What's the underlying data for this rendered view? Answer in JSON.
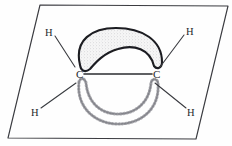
{
  "figure": {
    "background_color": "#fefefe",
    "ink_color": "#25262b",
    "plane": {
      "name": "molecular-plane",
      "shape": "parallelogram",
      "stroke_color": "#3a3b40",
      "points": "40,5 228,6 196,139 8,138"
    },
    "bond": {
      "label": "carbon-carbon sigma bond",
      "stroke_color": "#2b2c31",
      "x1": 84,
      "y1": 74,
      "x2": 152,
      "y2": 74
    },
    "atoms": [
      {
        "id": "c-left",
        "symbol": "C",
        "x": 76,
        "y": 69
      },
      {
        "id": "c-right",
        "symbol": "C",
        "x": 153,
        "y": 69
      }
    ],
    "hydrogens": [
      {
        "id": "h-top-left",
        "symbol": "H",
        "x": 45,
        "y": 28,
        "bond": {
          "x1": 55,
          "y1": 36,
          "x2": 75,
          "y2": 67
        }
      },
      {
        "id": "h-top-right",
        "symbol": "H",
        "x": 186,
        "y": 27,
        "bond": {
          "x1": 184,
          "y1": 35,
          "x2": 160,
          "y2": 67
        }
      },
      {
        "id": "h-bottom-left",
        "symbol": "H",
        "x": 31,
        "y": 108,
        "bond": {
          "x1": 41,
          "y1": 108,
          "x2": 76,
          "y2": 83
        }
      },
      {
        "id": "h-bottom-right",
        "symbol": "H",
        "x": 187,
        "y": 108,
        "bond": {
          "x1": 186,
          "y1": 108,
          "x2": 155,
          "y2": 83
        }
      }
    ],
    "lobes": [
      {
        "id": "pi-lobe-upper",
        "label": "upper pi orbital lobe (front, shaded)",
        "style": "filled-stippled",
        "outline_color": "#1b1c20",
        "fill_color": "#f4f4f4",
        "stipple_color": "#b9b9bd",
        "path": "M 80,65 C 74,40 92,28 116,28 C 142,28 162,40 162,62 C 162,68 157,70 154,66 C 150,49 134,44 118,49 C 104,53 96,62 90,69 C 85,73 81,71 80,65 Z"
      },
      {
        "id": "pi-lobe-lower",
        "label": "lower pi orbital lobe (back, dashed)",
        "style": "dashed-outline",
        "outline_color": "#6e6f75",
        "fill_color": "none",
        "path": "M 79,82 C 76,108 96,124 118,124 C 142,124 160,108 158,83 C 157,78 152,78 151,83 C 149,104 134,114 118,114 C 101,114 88,103 86,83 C 85,78 80,77 79,82 Z"
      }
    ]
  }
}
